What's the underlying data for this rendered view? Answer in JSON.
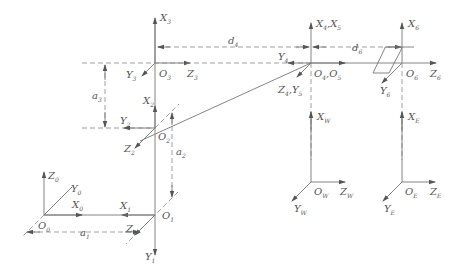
{
  "diagram": {
    "type": "robot-arm-coordinate-frames",
    "frames": [
      {
        "id": "O0",
        "origin": {
          "base": "O",
          "sub": "0"
        },
        "axes": [
          {
            "base": "Z",
            "sub": "0"
          },
          {
            "base": "Y",
            "sub": "0"
          },
          {
            "base": "X",
            "sub": "0"
          }
        ]
      },
      {
        "id": "O1",
        "origin": {
          "base": "O",
          "sub": "1"
        },
        "axes": [
          {
            "base": "X",
            "sub": "1"
          },
          {
            "base": "Y",
            "sub": "1"
          },
          {
            "base": "Z",
            "sub": "1"
          }
        ]
      },
      {
        "id": "O2",
        "origin": {
          "base": "O",
          "sub": "2"
        },
        "axes": [
          {
            "base": "X",
            "sub": "2"
          },
          {
            "base": "Y",
            "sub": "2"
          },
          {
            "base": "Z",
            "sub": "2"
          }
        ]
      },
      {
        "id": "O3",
        "origin": {
          "base": "O",
          "sub": "3"
        },
        "axes": [
          {
            "base": "X",
            "sub": "3"
          },
          {
            "base": "Y",
            "sub": "3"
          },
          {
            "base": "Z",
            "sub": "3"
          }
        ]
      },
      {
        "id": "O4O5",
        "origin": {
          "base": "O",
          "sub": "4",
          "base2": "O",
          "sub2": "5"
        },
        "axes": [
          {
            "base": "X",
            "sub": "4",
            "base2": "X",
            "sub2": "5"
          },
          {
            "base": "Y",
            "sub": "4"
          },
          {
            "base": "Z",
            "sub": "4",
            "base2": "Y",
            "sub2": "5"
          }
        ]
      },
      {
        "id": "O6",
        "origin": {
          "base": "O",
          "sub": "6"
        },
        "axes": [
          {
            "base": "X",
            "sub": "6"
          },
          {
            "base": "Y",
            "sub": "6"
          },
          {
            "base": "Z",
            "sub": "6"
          }
        ]
      },
      {
        "id": "OW",
        "origin": {
          "base": "O",
          "sub": "W"
        },
        "axes": [
          {
            "base": "X",
            "sub": "W"
          },
          {
            "base": "Y",
            "sub": "W"
          },
          {
            "base": "Z",
            "sub": "W"
          }
        ]
      },
      {
        "id": "OE",
        "origin": {
          "base": "O",
          "sub": "E"
        },
        "axes": [
          {
            "base": "X",
            "sub": "E"
          },
          {
            "base": "Y",
            "sub": "E"
          },
          {
            "base": "Z",
            "sub": "E"
          }
        ]
      }
    ],
    "dimensions": [
      {
        "base": "a",
        "sub": "1"
      },
      {
        "base": "a",
        "sub": "2"
      },
      {
        "base": "a",
        "sub": "3"
      },
      {
        "base": "d",
        "sub": "4"
      },
      {
        "base": "d",
        "sub": "6"
      }
    ]
  }
}
